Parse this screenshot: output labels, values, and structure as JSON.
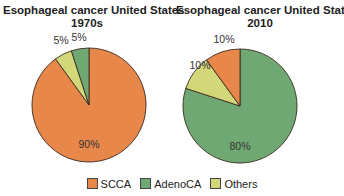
{
  "chart_data": [
    {
      "type": "pie",
      "title": "Esophageal cancer United States",
      "subtitle": "1970s",
      "categories": [
        "SCCA",
        "AdenoCA",
        "Others"
      ],
      "values": [
        90,
        5,
        5
      ],
      "labels": [
        "90%",
        "5%",
        "5%"
      ],
      "colors": [
        "#e8874a",
        "#6fa872",
        "#d2d77a"
      ]
    },
    {
      "type": "pie",
      "title": "Esophageal cancer United States",
      "subtitle": "2010",
      "categories": [
        "SCCA",
        "AdenoCA",
        "Others"
      ],
      "values": [
        10,
        80,
        10
      ],
      "labels": [
        "10%",
        "80%",
        "10%"
      ],
      "colors": [
        "#e8874a",
        "#6fa872",
        "#d2d77a"
      ]
    }
  ],
  "legend": {
    "position": "bottom",
    "items": [
      {
        "label": "SCCA",
        "color": "#e8874a"
      },
      {
        "label": "AdenoCA",
        "color": "#6fa872"
      },
      {
        "label": "Others",
        "color": "#d2d77a"
      }
    ]
  }
}
